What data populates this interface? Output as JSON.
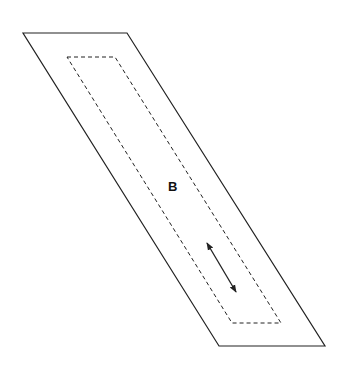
{
  "diagram": {
    "label": "B",
    "outer_shape": {
      "type": "parallelogram",
      "stroke": "#222222",
      "points": [
        [
          23,
          33
        ],
        [
          127,
          33
        ],
        [
          325,
          346
        ],
        [
          219,
          346
        ]
      ]
    },
    "inner_shape": {
      "type": "parallelogram",
      "style": "dashed",
      "stroke": "#222222",
      "points": [
        [
          67,
          57
        ],
        [
          115,
          57
        ],
        [
          281,
          323
        ],
        [
          232,
          323
        ]
      ]
    },
    "arrow": {
      "type": "double-headed",
      "from": [
        207,
        243
      ],
      "to": [
        236,
        292
      ]
    },
    "colors": {
      "line": "#222222",
      "background": "#ffffff"
    }
  }
}
